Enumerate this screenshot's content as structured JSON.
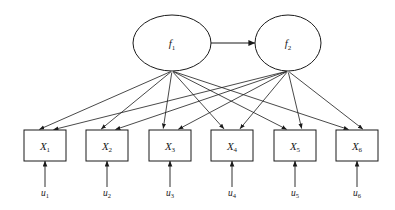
{
  "diagram": {
    "type": "path-diagram",
    "background_color": "#ffffff",
    "line_color": "#1a1a1a",
    "latent_factors": [
      {
        "id": "f1",
        "base": "f",
        "subscript": "1",
        "cx": 172,
        "cy": 43,
        "rx": 39,
        "ry": 28
      },
      {
        "id": "f2",
        "base": "f",
        "subscript": "2",
        "cx": 288,
        "cy": 43,
        "rx": 33,
        "ry": 28
      }
    ],
    "covariance": {
      "from": "f1",
      "to": "f2",
      "arrowheads": "both",
      "x1": 211,
      "x2": 255,
      "y": 43
    },
    "indicators": [
      {
        "id": "X1",
        "base": "X",
        "subscript": "1",
        "x": 24,
        "y": 130,
        "w": 42,
        "h": 31
      },
      {
        "id": "X2",
        "base": "X",
        "subscript": "2",
        "x": 86,
        "y": 130,
        "w": 42,
        "h": 31
      },
      {
        "id": "X3",
        "base": "X",
        "subscript": "3",
        "x": 149,
        "y": 130,
        "w": 42,
        "h": 31
      },
      {
        "id": "X4",
        "base": "X",
        "subscript": "4",
        "x": 211,
        "y": 130,
        "w": 42,
        "h": 31
      },
      {
        "id": "X5",
        "base": "X",
        "subscript": "5",
        "x": 274,
        "y": 130,
        "w": 42,
        "h": 31
      },
      {
        "id": "X6",
        "base": "X",
        "subscript": "6",
        "x": 336,
        "y": 130,
        "w": 42,
        "h": 31
      }
    ],
    "errors": [
      {
        "id": "u1",
        "base": "u",
        "subscript": "1",
        "x": 45,
        "label_y": 196,
        "top_y": 161
      },
      {
        "id": "u2",
        "base": "u",
        "subscript": "2",
        "x": 107,
        "label_y": 196,
        "top_y": 161
      },
      {
        "id": "u3",
        "base": "u",
        "subscript": "3",
        "x": 170,
        "label_y": 196,
        "top_y": 161
      },
      {
        "id": "u4",
        "base": "u",
        "subscript": "4",
        "x": 232,
        "label_y": 196,
        "top_y": 161
      },
      {
        "id": "u5",
        "base": "u",
        "subscript": "5",
        "x": 295,
        "label_y": 196,
        "top_y": 161
      },
      {
        "id": "u6",
        "base": "u",
        "subscript": "6",
        "x": 357,
        "label_y": 196,
        "top_y": 161
      }
    ],
    "loadings": [
      {
        "from": "f1",
        "to": "X1",
        "x1": 172,
        "y1": 71,
        "x2": 38,
        "y2": 130
      },
      {
        "from": "f1",
        "to": "X2",
        "x1": 172,
        "y1": 71,
        "x2": 100,
        "y2": 130
      },
      {
        "from": "f1",
        "to": "X3",
        "x1": 172,
        "y1": 71,
        "x2": 163,
        "y2": 130
      },
      {
        "from": "f1",
        "to": "X4",
        "x1": 172,
        "y1": 71,
        "x2": 225,
        "y2": 130
      },
      {
        "from": "f1",
        "to": "X5",
        "x1": 172,
        "y1": 71,
        "x2": 288,
        "y2": 130
      },
      {
        "from": "f1",
        "to": "X6",
        "x1": 172,
        "y1": 71,
        "x2": 350,
        "y2": 130
      },
      {
        "from": "f2",
        "to": "X1",
        "x1": 288,
        "y1": 71,
        "x2": 52,
        "y2": 130
      },
      {
        "from": "f2",
        "to": "X2",
        "x1": 288,
        "y1": 71,
        "x2": 114,
        "y2": 130
      },
      {
        "from": "f2",
        "to": "X3",
        "x1": 288,
        "y1": 71,
        "x2": 177,
        "y2": 130
      },
      {
        "from": "f2",
        "to": "X4",
        "x1": 288,
        "y1": 71,
        "x2": 239,
        "y2": 130
      },
      {
        "from": "f2",
        "to": "X5",
        "x1": 288,
        "y1": 71,
        "x2": 302,
        "y2": 130
      },
      {
        "from": "f2",
        "to": "X6",
        "x1": 288,
        "y1": 71,
        "x2": 364,
        "y2": 130
      }
    ]
  }
}
